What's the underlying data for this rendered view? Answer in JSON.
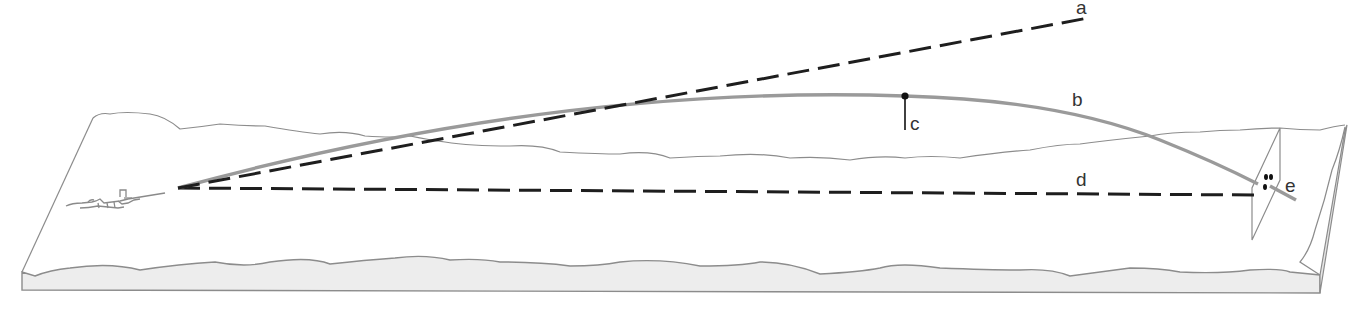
{
  "diagram": {
    "type": "bullet-trajectory-illustration",
    "labels": {
      "a": "a",
      "b": "b",
      "c": "c",
      "d": "d",
      "e": "e"
    },
    "elements": [
      {
        "id": "a",
        "label": "a",
        "kind": "dashed-line",
        "meaning": "line of bore / departure"
      },
      {
        "id": "b",
        "label": "b",
        "kind": "curve",
        "meaning": "trajectory"
      },
      {
        "id": "c",
        "label": "c",
        "kind": "point-marker",
        "meaning": "apex (maximum ordinate)"
      },
      {
        "id": "d",
        "label": "d",
        "kind": "dashed-line",
        "meaning": "line of sight"
      },
      {
        "id": "e",
        "label": "e",
        "kind": "target",
        "meaning": "point of impact on target"
      }
    ],
    "colors": {
      "terrain_outline": "#8c8c8c",
      "slab_face_fill": "#ececec",
      "trajectory": "#9a9a9a",
      "dashed_lines": "#1e1e1e",
      "apex_marker": "#111111",
      "label_text": "#333333"
    }
  }
}
